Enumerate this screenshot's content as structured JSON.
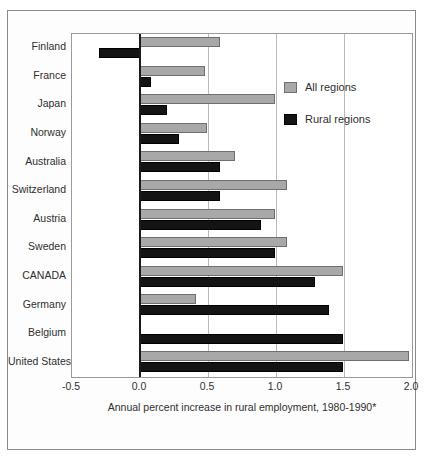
{
  "chart_data": {
    "type": "bar",
    "orientation": "horizontal",
    "title": "",
    "xlabel": "Annual  percent increase in rural employment, 1980-1990*",
    "ylabel": "",
    "xlim": [
      -0.5,
      2.0
    ],
    "xticks": [
      -0.5,
      0.0,
      0.5,
      1.0,
      1.5,
      2.0
    ],
    "xticklabels": [
      "-0.5",
      "0.0",
      "0.5",
      "1.0",
      "1.5",
      "2.0"
    ],
    "grid": true,
    "legend_position": "inside upper right",
    "categories": [
      "Finland",
      "France",
      "Japan",
      "Norway",
      "Australia",
      "Switzerland",
      "Austria",
      "Sweden",
      "CANADA",
      "Germany",
      "Belgium",
      "United States"
    ],
    "series": [
      {
        "name": "All regions",
        "color": "#a8a8a8",
        "values": [
          0.59,
          0.48,
          0.99,
          0.49,
          0.7,
          1.08,
          0.99,
          1.08,
          1.49,
          0.41,
          null,
          1.98
        ]
      },
      {
        "name": "Rural regions",
        "color": "#141414",
        "values": [
          -0.3,
          0.08,
          0.2,
          0.29,
          0.59,
          0.59,
          0.89,
          0.99,
          1.29,
          1.39,
          1.49,
          1.49
        ]
      }
    ]
  },
  "legend": {
    "items": [
      {
        "label": "All regions"
      },
      {
        "label": "Rural regions"
      }
    ]
  }
}
